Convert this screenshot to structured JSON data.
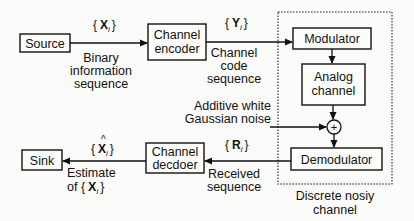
{
  "diagram": {
    "blocks": {
      "source": "Source",
      "channel_encoder": [
        "Channel",
        "encoder"
      ],
      "modulator": "Modulator",
      "analog_channel": [
        "Analog",
        "channel"
      ],
      "demodulator": "Demodulator",
      "channel_decoder": [
        "Channel",
        "decdoer"
      ],
      "sink": "Sink",
      "adder": "+"
    },
    "signals": {
      "x": {
        "open": "{",
        "letter": "X",
        "sub": "i",
        "close": "}"
      },
      "y": {
        "open": "{",
        "letter": "Y",
        "sub": "i",
        "close": "}"
      },
      "r": {
        "open": "{",
        "letter": "R",
        "sub": "i",
        "close": "}"
      },
      "x_hat": {
        "open": "{",
        "letter": "X",
        "hat": "^",
        "sub": "i",
        "close": "}"
      }
    },
    "labels": {
      "binary_info": [
        "Binary",
        "information",
        "sequence"
      ],
      "channel_code": [
        "Channel",
        "code",
        "sequence"
      ],
      "noise": [
        "Additive white",
        "Gaussian noise"
      ],
      "received": [
        "Received",
        "sequence"
      ],
      "estimate": [
        "Estimate",
        "of {",
        "X",
        "i",
        "}"
      ],
      "discrete_channel": [
        "Discrete nosiy",
        "channel"
      ]
    }
  }
}
